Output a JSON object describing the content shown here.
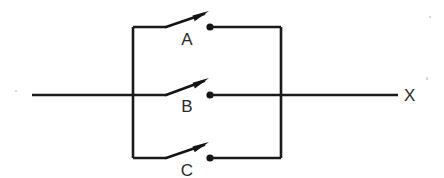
{
  "canvas": {
    "width": 444,
    "height": 178,
    "background": "#ffffff",
    "ink": "#1a1a1a"
  },
  "input_line": {
    "name": "input-line",
    "x1": 32,
    "y1": 95,
    "x2": 133,
    "y2": 95
  },
  "left_rail": {
    "name": "left-bus-rail",
    "x": 133,
    "y1": 27,
    "y2": 158
  },
  "right_rail": {
    "name": "right-bus-rail",
    "x": 281,
    "y1": 27,
    "y2": 158
  },
  "output_line": {
    "name": "output-line",
    "x1": 281,
    "y1": 95,
    "x2": 398,
    "y2": 95,
    "label": "X",
    "label_x": 404,
    "label_y": 101
  },
  "switches": [
    {
      "id": "switch-a",
      "label": "A",
      "state": "open",
      "y": 27,
      "in_wire": {
        "x1": 133,
        "x2": 166
      },
      "blade": {
        "x1": 166,
        "y1": 27,
        "x2": 204,
        "y2": 14
      },
      "arrow_tip": {
        "x": 209,
        "y": 11
      },
      "contact": {
        "x": 210,
        "y": 27,
        "r": 3.6
      },
      "out_wire": {
        "x1": 210,
        "x2": 281
      },
      "label_x": 187,
      "label_y": 45
    },
    {
      "id": "switch-b",
      "label": "B",
      "state": "open",
      "y": 95,
      "in_wire": {
        "x1": 133,
        "x2": 166
      },
      "blade": {
        "x1": 166,
        "y1": 95,
        "x2": 204,
        "y2": 81
      },
      "arrow_tip": {
        "x": 209,
        "y": 78
      },
      "contact": {
        "x": 210,
        "y": 95,
        "r": 3.6
      },
      "out_wire": {
        "x1": 210,
        "x2": 281
      },
      "label_x": 187,
      "label_y": 112
    },
    {
      "id": "switch-c",
      "label": "C",
      "state": "open",
      "y": 158,
      "in_wire": {
        "x1": 133,
        "x2": 166
      },
      "blade": {
        "x1": 166,
        "y1": 158,
        "x2": 204,
        "y2": 145
      },
      "arrow_tip": {
        "x": 209,
        "y": 142
      },
      "contact": {
        "x": 210,
        "y": 158,
        "r": 3.6
      },
      "out_wire": {
        "x1": 210,
        "x2": 281
      },
      "label_x": 187,
      "label_y": 176
    }
  ],
  "specks": [
    {
      "x": 426,
      "y": 77,
      "w": 2,
      "h": 3
    },
    {
      "x": 15,
      "y": 90,
      "w": 2,
      "h": 2
    },
    {
      "x": 429,
      "y": 16,
      "w": 2,
      "h": 2
    }
  ]
}
